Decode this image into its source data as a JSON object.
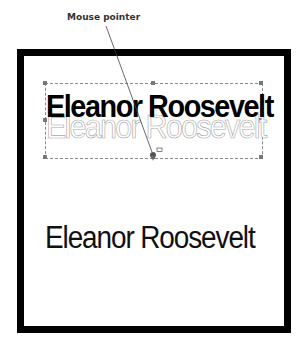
{
  "callout": {
    "label": "Mouse pointer"
  },
  "selected_text": {
    "text": "Eleanor Roosevelt",
    "style": "bold with outlined reflection"
  },
  "plain_text": {
    "text": "Eleanor Roosevelt"
  },
  "icons": {
    "pointer": "mouse-pointer-icon",
    "move_cursor": "cursor-box-icon"
  }
}
